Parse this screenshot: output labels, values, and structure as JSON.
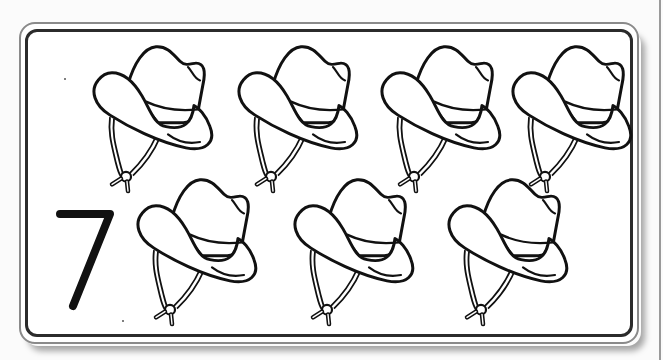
{
  "card": {
    "title": "Counting card",
    "numeral": "7",
    "object": "cowboy-hat",
    "count": 7,
    "colors": {
      "background": "#ffffff",
      "line": "#111111",
      "outer_border": "#8a8a8a",
      "inner_border": "#2b2b2b"
    }
  },
  "hats": [
    {
      "id": 1,
      "row": 1,
      "x": 88,
      "y": 42
    },
    {
      "id": 2,
      "row": 1,
      "x": 233,
      "y": 42
    },
    {
      "id": 3,
      "row": 1,
      "x": 376,
      "y": 42
    },
    {
      "id": 4,
      "row": 1,
      "x": 507,
      "y": 42
    },
    {
      "id": 5,
      "row": 2,
      "x": 132,
      "y": 175
    },
    {
      "id": 6,
      "row": 2,
      "x": 289,
      "y": 175
    },
    {
      "id": 7,
      "row": 2,
      "x": 443,
      "y": 175
    }
  ]
}
